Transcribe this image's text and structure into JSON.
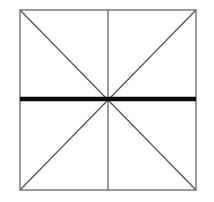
{
  "figure": {
    "canvas": {
      "width": 214,
      "height": 202,
      "background_color": "#ffffff"
    },
    "square": {
      "name": "outer-square",
      "left": 20,
      "top": 10,
      "right": 196,
      "bottom": 190,
      "width": 176,
      "height": 180,
      "stroke_color": "#4a4a4a",
      "stroke_width": 1.1
    },
    "center_point": {
      "x": 108,
      "y": 99
    },
    "lines": [
      {
        "name": "vertical-median",
        "x1": 108,
        "y1": 10,
        "x2": 108,
        "y2": 190,
        "stroke_color": "#4a4a4a",
        "stroke_width": 1.1,
        "emphasis": "thin"
      },
      {
        "name": "diagonal-tl-br",
        "x1": 20,
        "y1": 10,
        "x2": 196,
        "y2": 190,
        "stroke_color": "#4a4a4a",
        "stroke_width": 1.1,
        "emphasis": "thin"
      },
      {
        "name": "diagonal-bl-tr",
        "x1": 20,
        "y1": 190,
        "x2": 196,
        "y2": 10,
        "stroke_color": "#4a4a4a",
        "stroke_width": 1.1,
        "emphasis": "thin"
      },
      {
        "name": "horizontal-median-bold",
        "x1": 20,
        "y1": 99,
        "x2": 196,
        "y2": 99,
        "stroke_color": "#0a0a0a",
        "stroke_width": 4.6,
        "emphasis": "bold"
      }
    ],
    "labels": []
  },
  "chart_data": {
    "type": "diagram",
    "segments": [
      {
        "label": "outer-square",
        "weight": "thin"
      },
      {
        "label": "vertical-median",
        "weight": "thin"
      },
      {
        "label": "diagonal-tl-br",
        "weight": "thin"
      },
      {
        "label": "diagonal-bl-tr",
        "weight": "thin"
      },
      {
        "label": "horizontal-median",
        "weight": "bold"
      }
    ],
    "xlabel": "",
    "ylabel": "",
    "grid": false,
    "legend": "none"
  }
}
